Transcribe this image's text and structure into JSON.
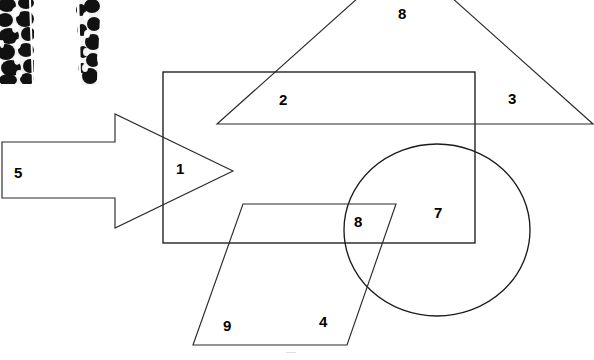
{
  "figure": {
    "canvas": {
      "width": 594,
      "height": 360,
      "background": "#ffffff"
    },
    "stroke_color": "#1a1a1a",
    "shapes": [
      {
        "name": "rectangle",
        "type": "rect",
        "x": 163,
        "y": 72,
        "width": 312,
        "height": 171
      },
      {
        "name": "triangle",
        "type": "polygon",
        "points": "378,0 217,124 593,124 432,0",
        "note": "apex clipped by top edge of image"
      },
      {
        "name": "arrow",
        "type": "polygon",
        "points": "2,142 115,142 115,114 233,171 115,228 115,198 2,198",
        "note": "right-pointing block arrow"
      },
      {
        "name": "circle",
        "type": "ellipse",
        "cx": 437,
        "cy": 230,
        "rx": 93,
        "ry": 86
      },
      {
        "name": "parallelogram",
        "type": "polygon",
        "points": "243,204 396,204 347,345 193,345"
      }
    ],
    "texture_strips": [
      {
        "name": "texture-strip-left",
        "x": 0,
        "y": 0,
        "width": 34,
        "height": 84
      },
      {
        "name": "texture-strip-right",
        "x": 74,
        "y": 0,
        "width": 30,
        "height": 85
      }
    ],
    "labels": [
      {
        "id": "label-1",
        "text": "1",
        "x": 176,
        "y": 161
      },
      {
        "id": "label-2",
        "text": "2",
        "x": 279,
        "y": 92
      },
      {
        "id": "label-3",
        "text": "3",
        "x": 508,
        "y": 91
      },
      {
        "id": "label-4",
        "text": "4",
        "x": 319,
        "y": 314
      },
      {
        "id": "label-5",
        "text": "5",
        "x": 14,
        "y": 165
      },
      {
        "id": "label-7",
        "text": "7",
        "x": 434,
        "y": 205
      },
      {
        "id": "label-8-top",
        "text": "8",
        "x": 398,
        "y": 6
      },
      {
        "id": "label-8-circle",
        "text": "8",
        "x": 354,
        "y": 214
      },
      {
        "id": "label-9",
        "text": "9",
        "x": 223,
        "y": 318
      }
    ]
  }
}
